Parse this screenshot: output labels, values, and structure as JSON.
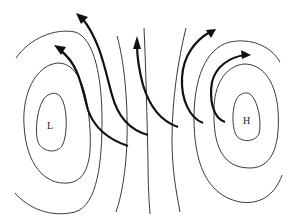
{
  "diagram": {
    "type": "pressure-system-isobars",
    "low_center": {
      "label": "L"
    },
    "high_center": {
      "label": "H"
    },
    "isobars_count": 10,
    "wind_arrows_count": 5,
    "colors": {
      "isobar": "#3a3a3a",
      "arrow": "#111111",
      "background": "#ffffff"
    }
  }
}
